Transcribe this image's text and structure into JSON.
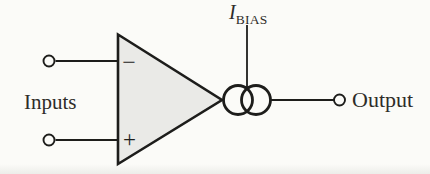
{
  "figure": {
    "kind": "circuit-schematic",
    "colors": {
      "background": "#fbfbf8",
      "line": "#1d1d1b",
      "amp_fill": "#eaeae7",
      "text": "#2e2c29"
    }
  },
  "labels": {
    "inputs": "Inputs",
    "output": "Output",
    "bias_main": "I",
    "bias_sub": "BIAS",
    "minus": "−",
    "plus": "+"
  }
}
